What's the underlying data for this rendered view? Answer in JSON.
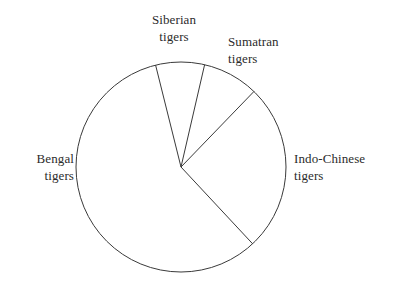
{
  "chart_data": {
    "type": "pie",
    "title": "",
    "subtitle": "",
    "xlabel": "",
    "ylabel": "",
    "legend_position": "none",
    "grid": false,
    "labels_placement": "outside-adjacent-to-slice",
    "categories": [
      "Sumatran tigers",
      "Siberian tigers",
      "Bengal tigers",
      "Indo-Chinese tigers"
    ],
    "values": [
      8.6,
      7.5,
      58.1,
      25.8
    ],
    "value_unit": "percent",
    "slices": [
      {
        "name": "Sumatran tigers",
        "label_line_1": "Sumatran",
        "label_line_2": "tigers",
        "percent": 8.6,
        "start_angle_deg": 46,
        "end_angle_deg": 77,
        "sweep_deg": 31,
        "fill": "none",
        "stroke": "#3a3a3a"
      },
      {
        "name": "Siberian tigers",
        "label_line_1": "Siberian",
        "label_line_2": "tigers",
        "percent": 7.5,
        "start_angle_deg": 77,
        "end_angle_deg": 104,
        "sweep_deg": 27,
        "fill": "none",
        "stroke": "#3a3a3a"
      },
      {
        "name": "Bengal tigers",
        "label_line_1": "Bengal",
        "label_line_2": "tigers",
        "percent": 58.1,
        "start_angle_deg": 104,
        "end_angle_deg": 313,
        "sweep_deg": 209,
        "fill": "none",
        "stroke": "#3a3a3a"
      },
      {
        "name": "Indo-Chinese tigers",
        "label_line_1": "Indo-Chinese",
        "label_line_2": "tigers",
        "percent": 25.8,
        "start_angle_deg": 313,
        "end_angle_deg": 406,
        "sweep_deg": 93,
        "fill": "none",
        "stroke": "#3a3a3a"
      }
    ],
    "geometry": {
      "center_x": 181,
      "center_y": 167,
      "radius": 105
    },
    "colors": {
      "background": "#ffffff",
      "stroke": "#3a3a3a",
      "text": "#2b2b2b"
    }
  }
}
